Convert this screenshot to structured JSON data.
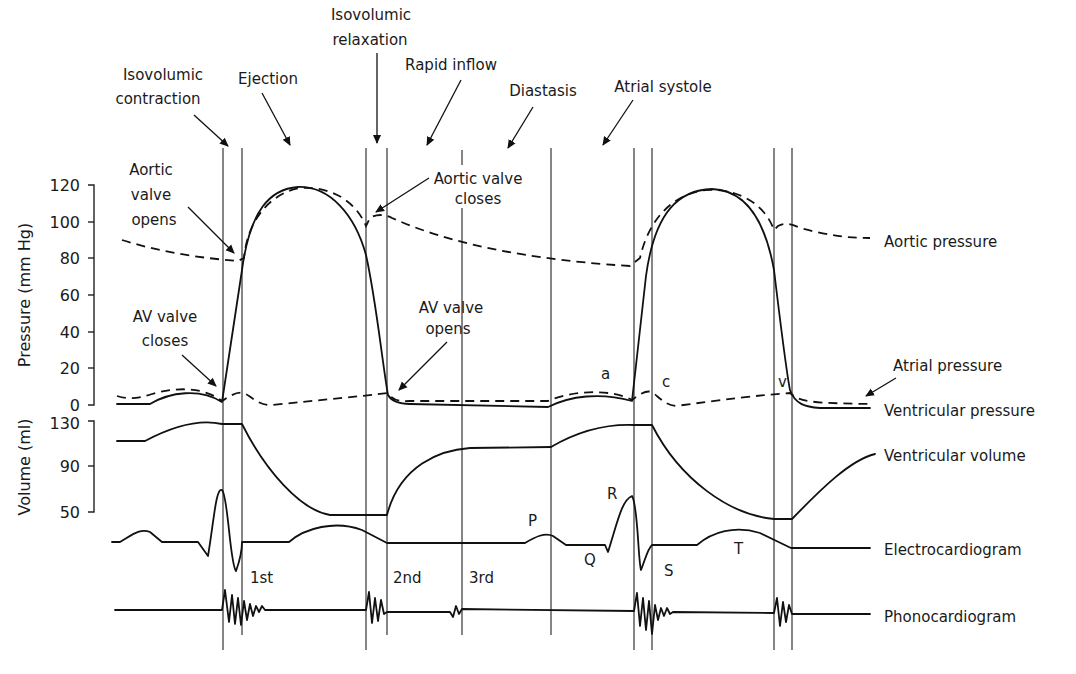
{
  "diagram": {
    "phases": [
      {
        "id": "isovolumic-contraction",
        "line1": "Isovolumic",
        "line2": "contraction"
      },
      {
        "id": "ejection",
        "line1": "Ejection"
      },
      {
        "id": "isovolumic-relaxation",
        "line1": "Isovolumic",
        "line2": "relaxation"
      },
      {
        "id": "rapid-inflow",
        "line1": "Rapid inflow"
      },
      {
        "id": "diastasis",
        "line1": "Diastasis"
      },
      {
        "id": "atrial-systole",
        "line1": "Atrial systole"
      }
    ],
    "events": {
      "aortic_valve_opens": {
        "line1": "Aortic",
        "line2": "valve",
        "line3": "opens"
      },
      "aortic_valve_closes": {
        "line1": "Aortic valve",
        "line2": "closes"
      },
      "av_valve_closes": {
        "line1": "AV valve",
        "line2": "closes"
      },
      "av_valve_opens": {
        "line1": "AV valve",
        "line2": "opens"
      }
    },
    "pressure_axis": {
      "title": "Pressure (mm Hg)",
      "ticks": [
        "120",
        "100",
        "80",
        "60",
        "40",
        "20",
        "0"
      ]
    },
    "volume_axis": {
      "title": "Volume (ml)",
      "ticks": [
        "130",
        "90",
        "50"
      ]
    },
    "trace_labels": {
      "aortic_pressure": "Aortic pressure",
      "atrial_pressure": "Atrial pressure",
      "ventricular_pressure": "Ventricular pressure",
      "ventricular_volume": "Ventricular volume",
      "electrocardiogram": "Electrocardiogram",
      "phonocardiogram": "Phonocardiogram"
    },
    "wave_labels": {
      "a": "a",
      "c": "c",
      "v": "v",
      "P": "P",
      "Q": "Q",
      "R": "R",
      "S": "S",
      "T": "T"
    },
    "heart_sounds": {
      "first": "1st",
      "second": "2nd",
      "third": "3rd"
    }
  }
}
